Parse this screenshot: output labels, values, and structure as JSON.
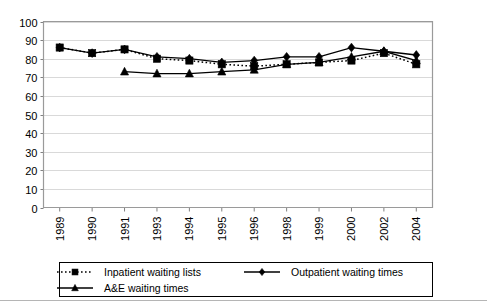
{
  "chart_data": {
    "type": "line",
    "title": "",
    "subtitle": "",
    "xlabel": "",
    "ylabel": "",
    "ylim": [
      0,
      100
    ],
    "ytick_step": 10,
    "grid": true,
    "legend_position": "bottom",
    "categories": [
      "1989",
      "1990",
      "1991",
      "1993",
      "1994",
      "1995",
      "1996",
      "1998",
      "1999",
      "2000",
      "2002",
      "2004"
    ],
    "ytick_labels": [
      "100",
      "90",
      "80",
      "70",
      "60",
      "50",
      "40",
      "30",
      "20",
      "10",
      "0"
    ],
    "series": [
      {
        "name": "Inpatient waiting lists",
        "marker": "square",
        "line_style": "dotted",
        "color": "#000000",
        "values": [
          86,
          83,
          85,
          80,
          79,
          77,
          76,
          77,
          78,
          79,
          83,
          77
        ]
      },
      {
        "name": "Outpatient waiting times",
        "marker": "diamond",
        "line_style": "solid",
        "color": "#000000",
        "values": [
          86,
          83,
          85,
          81,
          80,
          78,
          79,
          81,
          81,
          86,
          84,
          82
        ]
      },
      {
        "name": "A&E waiting times",
        "marker": "triangle",
        "line_style": "solid",
        "color": "#000000",
        "values": [
          null,
          null,
          73,
          72,
          72,
          73,
          74,
          77,
          78,
          81,
          84,
          79
        ]
      }
    ]
  },
  "legend": {
    "entries": [
      {
        "label": "Inpatient waiting lists",
        "marker": "square",
        "line_style": "dotted"
      },
      {
        "label": "Outpatient waiting times",
        "marker": "diamond",
        "line_style": "solid"
      },
      {
        "label": "A&E waiting times",
        "marker": "triangle",
        "line_style": "solid"
      }
    ]
  }
}
